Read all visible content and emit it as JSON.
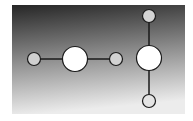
{
  "diagram": {
    "panel": {
      "x": 12,
      "y": 5,
      "width": 173,
      "height": 109,
      "gradient_top": "#262626",
      "gradient_mid": "#8a8a8a",
      "gradient_bottom": "#ececec"
    },
    "edge_color": "#1a1a1a",
    "node_stroke": "#1a1a1a",
    "groups": [
      {
        "name": "horizontal-molecule",
        "orientation": "horizontal",
        "nodes": [
          {
            "id": "h-left",
            "cx": 34,
            "cy": 59,
            "r": 6.5,
            "fill": "#cfcfcf",
            "size": "small"
          },
          {
            "id": "h-center",
            "cx": 75,
            "cy": 59,
            "r": 12.5,
            "fill": "#ffffff",
            "size": "large"
          },
          {
            "id": "h-right",
            "cx": 116,
            "cy": 59,
            "r": 6.5,
            "fill": "#d2d2d2",
            "size": "small"
          }
        ],
        "edges": [
          {
            "from": "h-left",
            "to": "h-center"
          },
          {
            "from": "h-center",
            "to": "h-right"
          }
        ]
      },
      {
        "name": "vertical-molecule",
        "orientation": "vertical",
        "nodes": [
          {
            "id": "v-top",
            "cx": 149,
            "cy": 16,
            "r": 6.5,
            "fill": "#d4d4d4",
            "size": "small"
          },
          {
            "id": "v-center",
            "cx": 149,
            "cy": 58,
            "r": 12.5,
            "fill": "#ffffff",
            "size": "large"
          },
          {
            "id": "v-bottom",
            "cx": 149,
            "cy": 101,
            "r": 6.5,
            "fill": "#e4e4e4",
            "size": "small"
          }
        ],
        "edges": [
          {
            "from": "v-top",
            "to": "v-center"
          },
          {
            "from": "v-center",
            "to": "v-bottom"
          }
        ]
      }
    ]
  }
}
